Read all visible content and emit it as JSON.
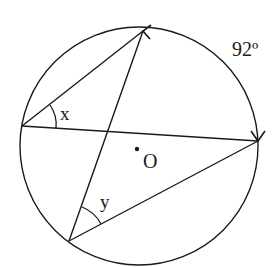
{
  "diagram": {
    "type": "circle-geometry",
    "circle": {
      "cx": 139,
      "cy": 145,
      "r": 119,
      "center_label": "O"
    },
    "points": {
      "A": {
        "x": 143,
        "y": 31
      },
      "L": {
        "x": 22,
        "y": 126
      },
      "R": {
        "x": 258,
        "y": 141
      },
      "B": {
        "x": 69,
        "y": 241
      }
    },
    "chords": [
      {
        "from": "L",
        "to": "A"
      },
      {
        "from": "L",
        "to": "R"
      },
      {
        "from": "A",
        "to": "B"
      },
      {
        "from": "B",
        "to": "R"
      }
    ],
    "labels": {
      "angle_x": "x",
      "angle_y": "y",
      "arc": "92º",
      "center": "O"
    },
    "stroke_color": "#1a1a1a"
  }
}
